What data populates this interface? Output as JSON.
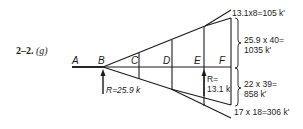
{
  "problem": {
    "number": "2–2.",
    "part": "(g)"
  },
  "points": {
    "A": "A",
    "B": "B",
    "C": "C",
    "D": "D",
    "E": "E",
    "F": "F"
  },
  "reactions": {
    "R_B": "R=25.9 k",
    "R_E_line1": "R=",
    "R_E_line2": "13.1 k"
  },
  "moments": {
    "m1": "13.1x8=105 k'",
    "m2_line1": "25.9 x 40=",
    "m2_line2": "1035 k'",
    "m3_line1": "22 x 39=",
    "m3_line2": "858 k'",
    "m4": "17 x 18=306 k'"
  },
  "colors": {
    "ink": "#1a1a1a",
    "background": "#ffffff"
  }
}
